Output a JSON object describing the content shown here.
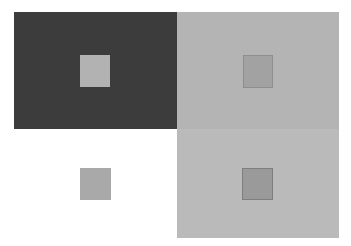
{
  "illusion": {
    "description": "Simultaneous contrast illusion: identical gray squares on backgrounds of differing lightness",
    "panels": [
      {
        "id": "top-left",
        "background": "#3c3c3c",
        "square_color": "#b2b2b2"
      },
      {
        "id": "top-right",
        "background": "#b4b4b4",
        "square_color": "#a2a2a2"
      },
      {
        "id": "bottom-left",
        "background": "#ffffff",
        "square_color": "#a9a9a9"
      },
      {
        "id": "bottom-right",
        "background": "#bababa",
        "square_color": "#9a9a9a"
      }
    ]
  }
}
